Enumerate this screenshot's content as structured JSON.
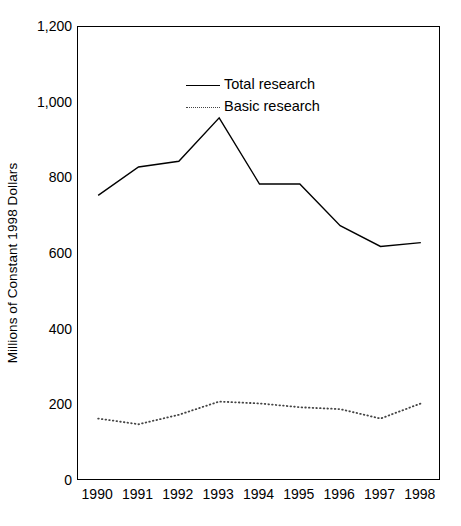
{
  "chart_data": {
    "type": "line",
    "title": "",
    "xlabel": "",
    "ylabel": "Millions of Constant 1998 Dollars",
    "categories": [
      "1990",
      "1991",
      "1992",
      "1993",
      "1994",
      "1995",
      "1996",
      "1997",
      "1998"
    ],
    "x": [
      1990,
      1991,
      1992,
      1993,
      1994,
      1995,
      1996,
      1997,
      1998
    ],
    "series": [
      {
        "name": "Total research",
        "style": "solid",
        "color": "#000000",
        "values": [
          755,
          830,
          845,
          960,
          785,
          785,
          675,
          620,
          630
        ]
      },
      {
        "name": "Basic research",
        "style": "dotted",
        "color": "#444444",
        "values": [
          165,
          150,
          175,
          210,
          205,
          195,
          190,
          165,
          205
        ]
      }
    ],
    "ylim": [
      0,
      1200
    ],
    "yticks": [
      0,
      200,
      400,
      600,
      800,
      1000,
      1200
    ],
    "ytick_labels": [
      "0",
      "200",
      "400",
      "600",
      "800",
      "1,000",
      "1,200"
    ],
    "grid": false,
    "legend_position": "upper-left-inside"
  },
  "legend": {
    "items": [
      {
        "label": "Total research",
        "style": "solid"
      },
      {
        "label": "Basic research",
        "style": "dotted"
      }
    ]
  },
  "axes": {
    "y_title": "Millions of Constant 1998 Dollars"
  }
}
